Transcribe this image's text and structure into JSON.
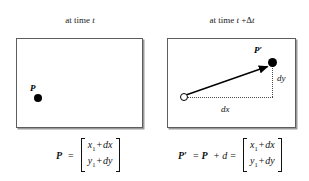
{
  "figure": {
    "background_color": "#ffffff",
    "line_color": "#000000",
    "box_border_color": "#5d5d5d"
  },
  "left_panel": {
    "caption_prefix": "at time ",
    "caption_var": "t",
    "point_label": "P",
    "formula": {
      "lhs": "P",
      "equals": "=",
      "matrix_row1": {
        "base": "x",
        "sub": "1",
        "plus": "+",
        "delta": "dx"
      },
      "matrix_row2": {
        "base": "y",
        "sub": "1",
        "plus": "+",
        "delta": "dy"
      }
    }
  },
  "right_panel": {
    "caption_prefix": "at time ",
    "caption_var": "t",
    "caption_suffix": " +Δ",
    "caption_var2": "t",
    "point_label": "P′",
    "dx_label": "dx",
    "dy_label": "dy",
    "formula": {
      "lhs": "P′",
      "equals1": "=",
      "term1": "P",
      "plus": "+",
      "term2": "d",
      "equals2": "=",
      "matrix_row1": {
        "base": "x",
        "sub": "1",
        "plus": "+",
        "delta": "dx"
      },
      "matrix_row2": {
        "base": "y",
        "sub": "1",
        "plus": "+",
        "delta": "dy"
      }
    }
  }
}
